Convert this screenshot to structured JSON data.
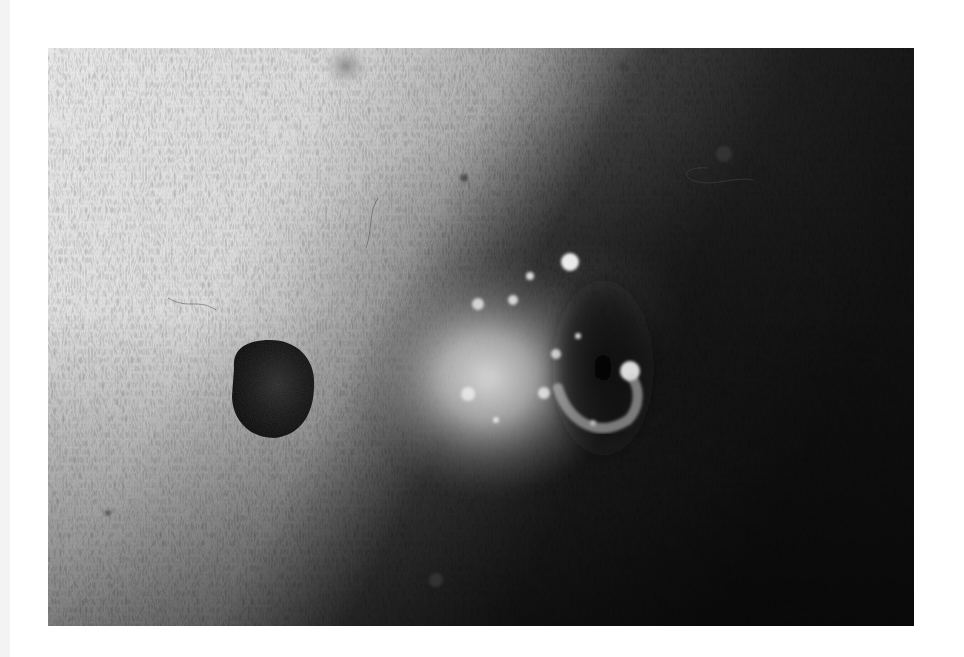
{
  "page": {
    "background": "#ffffff"
  },
  "photo": {
    "kind": "grayscale clinical skin photograph",
    "frame": {
      "x": 48,
      "y": 48,
      "width": 866,
      "height": 578
    },
    "tones": {
      "light_skin": "#e9e9e9",
      "mid_skin": "#9a9a9a",
      "dark_skin": "#1c1c1c",
      "deepest": "#0a0a0a",
      "lesion": "#141414",
      "highlight": "#ffffff"
    },
    "features": [
      {
        "name": "pigmented-nodule",
        "cx": 224,
        "cy": 340,
        "rx": 44,
        "ry": 48
      },
      {
        "name": "glistening-erosion",
        "cx": 470,
        "cy": 300,
        "rx": 110,
        "ry": 110
      },
      {
        "name": "small-papule-top",
        "cx": 298,
        "cy": 20,
        "rx": 22,
        "ry": 22
      },
      {
        "name": "small-dark-spot-bottom",
        "cx": 388,
        "cy": 532,
        "rx": 10,
        "ry": 9
      }
    ]
  }
}
